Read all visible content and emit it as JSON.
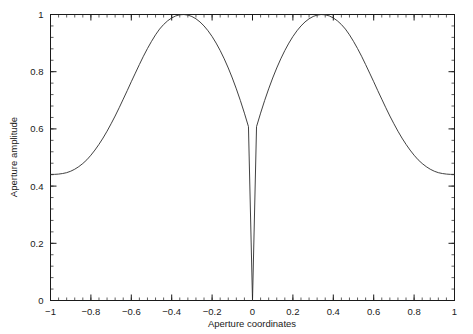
{
  "chart_data": {
    "type": "line",
    "title": "",
    "xlabel": "Aperture coordinates",
    "ylabel": "Aperture amplitude",
    "xlim": [
      -1,
      1
    ],
    "ylim": [
      0,
      1
    ],
    "grid": false,
    "legend": null,
    "x_ticks": [
      -1,
      -0.8,
      -0.6,
      -0.4,
      -0.2,
      0,
      0.2,
      0.4,
      0.6,
      0.8,
      1
    ],
    "x_tick_labels": [
      "−1",
      "−0.8",
      "−0.6",
      "−0.4",
      "−0.2",
      "0",
      "0.2",
      "0.4",
      "0.6",
      "0.8",
      "1"
    ],
    "y_ticks": [
      0,
      0.2,
      0.4,
      0.6,
      0.8,
      1
    ],
    "y_tick_labels": [
      "0",
      "0.2",
      "0.4",
      "0.6",
      "0.8",
      "1"
    ],
    "x_minor_tick_step": 0.04,
    "y_minor_tick_step": 0.04,
    "series": [
      {
        "name": "Aperture amplitude",
        "color": "#2b2b2b",
        "x": [
          -1.0,
          -0.98,
          -0.96,
          -0.94,
          -0.92,
          -0.9,
          -0.88,
          -0.86,
          -0.84,
          -0.82,
          -0.8,
          -0.78,
          -0.76,
          -0.74,
          -0.72,
          -0.7,
          -0.68,
          -0.66,
          -0.64,
          -0.62,
          -0.6,
          -0.58,
          -0.56,
          -0.54,
          -0.52,
          -0.5,
          -0.48,
          -0.47,
          -0.46,
          -0.44,
          -0.42,
          -0.4,
          -0.38,
          -0.36,
          -0.34,
          -0.32,
          -0.3,
          -0.28,
          -0.26,
          -0.24,
          -0.22,
          -0.2,
          -0.18,
          -0.16,
          -0.14,
          -0.12,
          -0.1,
          -0.08,
          -0.06,
          -0.04,
          -0.02,
          0.0,
          0.02,
          0.04,
          0.06,
          0.08,
          0.1,
          0.12,
          0.14,
          0.16,
          0.18,
          0.2,
          0.22,
          0.24,
          0.26,
          0.28,
          0.3,
          0.32,
          0.34,
          0.36,
          0.38,
          0.4,
          0.42,
          0.44,
          0.46,
          0.47,
          0.48,
          0.5,
          0.52,
          0.54,
          0.56,
          0.58,
          0.6,
          0.62,
          0.64,
          0.66,
          0.68,
          0.7,
          0.72,
          0.74,
          0.76,
          0.78,
          0.8,
          0.82,
          0.84,
          0.86,
          0.88,
          0.9,
          0.92,
          0.94,
          0.96,
          0.98,
          1.0
        ],
        "y": [
          0.441,
          0.441,
          0.442,
          0.444,
          0.447,
          0.452,
          0.459,
          0.468,
          0.479,
          0.492,
          0.508,
          0.526,
          0.546,
          0.568,
          0.592,
          0.618,
          0.645,
          0.674,
          0.704,
          0.734,
          0.765,
          0.795,
          0.825,
          0.854,
          0.881,
          0.906,
          0.929,
          0.939,
          0.949,
          0.965,
          0.978,
          0.988,
          0.995,
          0.999,
          1.0,
          0.998,
          0.993,
          0.985,
          0.974,
          0.96,
          0.943,
          0.923,
          0.9,
          0.874,
          0.845,
          0.813,
          0.778,
          0.74,
          0.699,
          0.655,
          0.608,
          0.0,
          0.608,
          0.655,
          0.699,
          0.74,
          0.778,
          0.813,
          0.845,
          0.874,
          0.9,
          0.923,
          0.943,
          0.96,
          0.974,
          0.985,
          0.993,
          0.998,
          1.0,
          0.999,
          0.995,
          0.988,
          0.978,
          0.965,
          0.949,
          0.939,
          0.929,
          0.906,
          0.881,
          0.854,
          0.825,
          0.795,
          0.765,
          0.734,
          0.704,
          0.674,
          0.645,
          0.618,
          0.592,
          0.568,
          0.546,
          0.526,
          0.508,
          0.492,
          0.479,
          0.468,
          0.459,
          0.452,
          0.447,
          0.444,
          0.442,
          0.441,
          0.441
        ]
      }
    ],
    "annotations": [
      {
        "text": "peak amplitude 1 at x ≈ −0.47"
      },
      {
        "text": "peak amplitude 1 at x ≈ 0.47"
      },
      {
        "text": "null (amplitude 0) at x = 0"
      }
    ]
  },
  "axes": {
    "x_title": "Aperture coordinates",
    "y_title": "Aperture amplitude"
  }
}
